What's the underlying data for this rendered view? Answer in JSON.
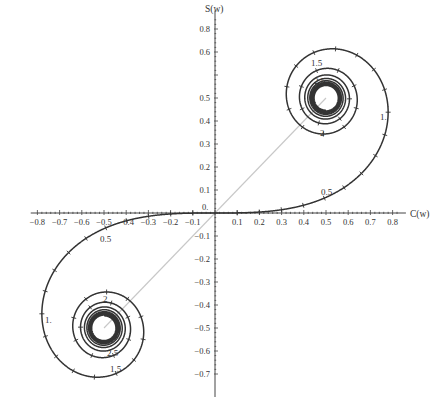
{
  "chart_data": {
    "type": "line",
    "title": "",
    "xlabel": "C(w)",
    "ylabel": "S(w)",
    "xlim": [
      -0.85,
      0.85
    ],
    "ylim": [
      -0.8,
      0.9
    ],
    "grid": false,
    "legend": null,
    "x_ticks": [
      -0.8,
      -0.7,
      -0.6,
      -0.5,
      -0.4,
      -0.3,
      -0.2,
      -0.1,
      0.1,
      0.2,
      0.3,
      0.4,
      0.5,
      0.6,
      0.7,
      0.8
    ],
    "x_tick_labels": [
      "−0.8",
      "−0.7",
      "−0.6",
      "−0.5",
      "−0.4",
      "−0.3",
      "−0.2",
      "−0.1",
      "0.1",
      "0.2",
      "0.3",
      "0.4",
      "0.5",
      "0.6",
      "0.7",
      "0.8"
    ],
    "y_ticks": [
      0.8,
      0.7,
      0.5,
      0.4,
      0.3,
      0.2,
      0.1,
      -0.1,
      -0.2,
      -0.3,
      -0.4,
      -0.5,
      -0.6,
      -0.7
    ],
    "y_tick_labels": [
      "0.8",
      "0.6",
      "0.5",
      "0.4",
      "0.3",
      "0.2",
      "0.1",
      "−0.1",
      "−0.2",
      "−0.3",
      "−0.4",
      "−0.5",
      "−0.6",
      "−0.7"
    ],
    "curve": {
      "parametric": "C(w)=∫0^w cos(πt²/2)dt, S(w)=∫0^w sin(πt²/2)dt",
      "w_range": [
        -6,
        6
      ],
      "tick_spacing_w": 0.1,
      "color": "#333333",
      "limit_points": [
        [
          0.5,
          0.5
        ],
        [
          -0.5,
          -0.5
        ]
      ]
    },
    "reference_line": {
      "from": [
        -0.5,
        -0.5
      ],
      "to": [
        0.5,
        0.5
      ],
      "color": "#c8c8c8"
    },
    "annotations": [
      {
        "text": "0.",
        "w": 0
      },
      {
        "text": "0.5",
        "w": 0.5
      },
      {
        "text": "1.",
        "w": 1.0
      },
      {
        "text": "1.5",
        "w": 1.5
      },
      {
        "text": "2",
        "w": 2.0
      },
      {
        "text": "2.5",
        "w": 2.5
      },
      {
        "text": "0.5",
        "w": -0.5
      },
      {
        "text": "1.",
        "w": -1.0
      },
      {
        "text": "1.5",
        "w": -1.5
      },
      {
        "text": "2",
        "w": -2.0
      },
      {
        "text": "2.5",
        "w": -2.5
      }
    ]
  },
  "layout": {
    "origin_px": [
      215,
      213
    ],
    "x_px_per_unit": 222,
    "y_px_per_unit": 230
  },
  "labels": {
    "x_axis_title": "C(w)",
    "y_axis_title": "S(w)",
    "origin": "0."
  },
  "param_labels": [
    {
      "text": "0.5",
      "x": 321,
      "y": 195
    },
    {
      "text": "1.",
      "x": 380,
      "y": 120
    },
    {
      "text": "1.5",
      "x": 311,
      "y": 66
    },
    {
      "text": "2.5",
      "x": 314,
      "y": 84
    },
    {
      "text": "2",
      "x": 320,
      "y": 136
    },
    {
      "text": "0.5",
      "x": 100,
      "y": 242
    },
    {
      "text": "1.",
      "x": 45,
      "y": 323
    },
    {
      "text": "2",
      "x": 103,
      "y": 302
    },
    {
      "text": "2.5",
      "x": 107,
      "y": 356
    },
    {
      "text": "1.5",
      "x": 110,
      "y": 372
    }
  ]
}
